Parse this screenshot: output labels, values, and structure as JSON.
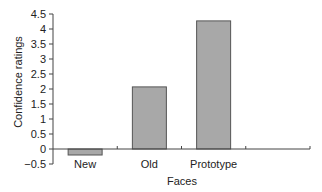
{
  "chart_data": {
    "type": "bar",
    "title": "",
    "xlabel": "Faces",
    "ylabel": "Confidence ratings",
    "categories": [
      "New",
      "Old",
      "Prototype",
      ""
    ],
    "values": [
      -0.2,
      2.07,
      4.27,
      null
    ],
    "ylim": [
      -0.5,
      4.5
    ],
    "yticks": [
      "-0.5",
      "0",
      "0.5",
      "1",
      "1.5",
      "2",
      "2.5",
      "3",
      "3.5",
      "4",
      "4.5"
    ],
    "grid": false,
    "legend": null,
    "bar_color": "#a8a8a8",
    "bar_edge_color": "#555555"
  }
}
